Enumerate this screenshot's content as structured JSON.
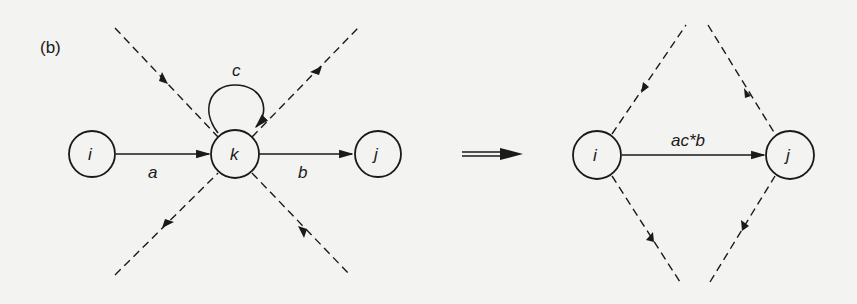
{
  "figure": {
    "panel_label": "(b)",
    "left_graph": {
      "nodes": [
        {
          "id": "i",
          "label": "i"
        },
        {
          "id": "k",
          "label": "k"
        },
        {
          "id": "j",
          "label": "j"
        }
      ],
      "edges": [
        {
          "from": "i",
          "to": "k",
          "label": "a"
        },
        {
          "from": "k",
          "to": "j",
          "label": "b"
        },
        {
          "from": "k",
          "to": "k",
          "label": "c"
        }
      ]
    },
    "transform_arrow": "implies",
    "right_graph": {
      "nodes": [
        {
          "id": "i",
          "label": "i"
        },
        {
          "id": "j",
          "label": "j"
        }
      ],
      "edges": [
        {
          "from": "i",
          "to": "j",
          "label": "ac*b"
        }
      ]
    },
    "colors": {
      "ink": "#1a1a1a",
      "background": "#f3f3f1"
    }
  }
}
